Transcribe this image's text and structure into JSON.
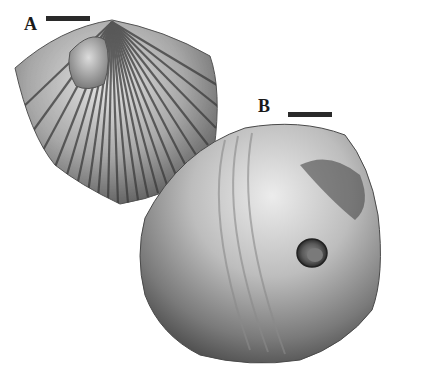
{
  "figure": {
    "panels": [
      {
        "label": "A",
        "subject": "ribbed-shell-with-umbo-boss"
      },
      {
        "label": "B",
        "subject": "smooth-shell-with-bore-hole"
      }
    ],
    "colors": {
      "background": "#ffffff",
      "shell_light": "#d8d8d8",
      "shell_mid": "#9a9a9a",
      "shell_dark": "#4a4a4a",
      "label": "#1a1a1a"
    }
  }
}
